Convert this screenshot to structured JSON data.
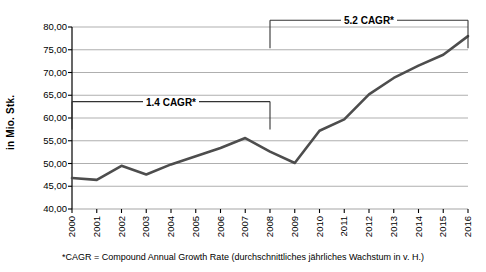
{
  "chart_data": {
    "type": "line",
    "title": "",
    "subtitle": "",
    "xlabel": "",
    "ylabel": "in Mio. Stk.",
    "categories": [
      "2000",
      "2001",
      "2002",
      "2003",
      "2004",
      "2005",
      "2006",
      "2007",
      "2008",
      "2009",
      "2010",
      "2011",
      "2012",
      "2013",
      "2014",
      "2015",
      "2016"
    ],
    "values": [
      46.8,
      46.4,
      49.5,
      47.6,
      49.8,
      51.6,
      53.4,
      55.6,
      52.6,
      50.1,
      57.2,
      59.7,
      65.2,
      68.8,
      71.5,
      73.9,
      78.0
    ],
    "ylim": [
      40.0,
      80.0
    ],
    "ytick_values": [
      40.0,
      45.0,
      50.0,
      55.0,
      60.0,
      65.0,
      70.0,
      75.0,
      80.0
    ],
    "ytick_labels": [
      "40,00",
      "45,00",
      "50,00",
      "55,00",
      "60,00",
      "65,00",
      "70,00",
      "75,00",
      "80,00"
    ],
    "grid": true,
    "grid_axis": "y",
    "legend": false,
    "legend_position": "none",
    "line_color": "#4d4d4d",
    "grid_color": "#a6a6a6",
    "axis_color": "#000000",
    "annotations": [
      {
        "name": "cagr-lower",
        "label": "1.4 CAGR*",
        "from_category": "2000",
        "to_category": "2008",
        "value_level": 63.6
      },
      {
        "name": "cagr-upper",
        "label": "5.2 CAGR*",
        "from_category": "2008",
        "to_category": "2016",
        "value_level": 81.5
      }
    ]
  },
  "footnote": {
    "text": "*CAGR = Compound Annual Growth Rate (durchschnittliches jährliches Wachstum in v. H.)"
  }
}
